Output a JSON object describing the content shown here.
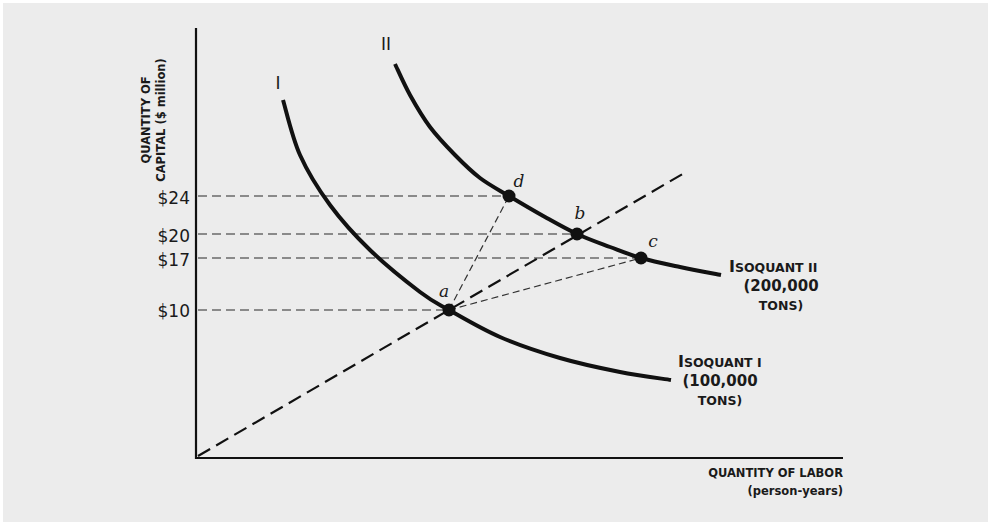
{
  "chart_data": {
    "type": "line",
    "title": "",
    "xlabel": "QUANTITY OF LABOR",
    "xlabel_sub": "(person-years)",
    "ylabel_line1": "QUANTITY OF",
    "ylabel_line2": "CAPITAL ($ million)",
    "yticks": [
      {
        "label": "$24",
        "value": 24,
        "py": 198
      },
      {
        "label": "$20",
        "value": 20,
        "py": 236
      },
      {
        "label": "$17",
        "value": 17,
        "py": 260
      },
      {
        "label": "$10",
        "value": 10,
        "py": 311
      }
    ],
    "xticks": [],
    "grid": false,
    "series": [
      {
        "name": "Isoquant I",
        "tag": "I",
        "output": "100,000 tons",
        "label_lines": [
          "Isoquant I",
          "(100,000",
          "tons)"
        ],
        "style": "solid",
        "pixel_path": [
          [
            283,
            100
          ],
          [
            300,
            155
          ],
          [
            330,
            205
          ],
          [
            370,
            250
          ],
          [
            420,
            292
          ],
          [
            449,
            310
          ],
          [
            500,
            337
          ],
          [
            560,
            358
          ],
          [
            620,
            372
          ],
          [
            671,
            380
          ]
        ]
      },
      {
        "name": "Isoquant II",
        "tag": "II",
        "output": "200,000 tons",
        "label_lines": [
          "Isoquant II",
          "(200,000",
          "tons)"
        ],
        "style": "solid",
        "pixel_path": [
          [
            395,
            64
          ],
          [
            410,
            95
          ],
          [
            430,
            127
          ],
          [
            455,
            155
          ],
          [
            480,
            178
          ],
          [
            509,
            196
          ],
          [
            545,
            217
          ],
          [
            577,
            234
          ],
          [
            610,
            247
          ],
          [
            641,
            258
          ],
          [
            680,
            267
          ],
          [
            721,
            275
          ]
        ]
      }
    ],
    "points": [
      {
        "label": "a",
        "capital": 10,
        "px": 449,
        "py": 310,
        "curve": "I"
      },
      {
        "label": "b",
        "capital": 20,
        "px": 577,
        "py": 234,
        "curve": "II"
      },
      {
        "label": "c",
        "capital": 17,
        "px": 641,
        "py": 258,
        "curve": "II"
      },
      {
        "label": "d",
        "capital": 24,
        "px": 509,
        "py": 196,
        "curve": "II"
      }
    ],
    "rays": [
      {
        "from": "origin",
        "through": "a",
        "to": "b",
        "extends_to": [
          686,
          172
        ],
        "style": "bold-dashed"
      },
      {
        "from": "a",
        "to": "c",
        "style": "thin-dashed"
      },
      {
        "from": "a",
        "to": "d",
        "style": "thin-dashed"
      }
    ],
    "axis_pixels": {
      "origin": [
        196,
        458
      ],
      "x_end": [
        843,
        458
      ],
      "y_top": [
        196,
        28
      ]
    }
  },
  "labels": {
    "y_line1": "QUANTITY OF",
    "y_line2": "CAPITAL ($ million)",
    "x_line1": "QUANTITY OF LABOR",
    "x_line2": "(person-years)",
    "tag_I": "I",
    "tag_II": "II",
    "isoI_cap": "I",
    "isoI_rest": "SOQUANT I",
    "isoI_l2": "(100,000",
    "isoI_l3": "TONS)",
    "isoII_cap": "I",
    "isoII_rest": "SOQUANT II",
    "isoII_l2": "(200,000",
    "isoII_l3": "TONS)",
    "tick_24": "$24",
    "tick_20": "$20",
    "tick_17": "$17",
    "tick_10": "$10",
    "pt_a": "a",
    "pt_b": "b",
    "pt_c": "c",
    "pt_d": "d"
  }
}
